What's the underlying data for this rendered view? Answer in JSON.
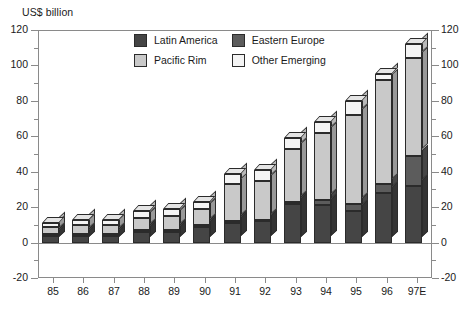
{
  "axis_title": "US$ billion",
  "legend": {
    "items": [
      {
        "label": "Latin America",
        "color": "#454545"
      },
      {
        "label": "Eastern Europe",
        "color": "#5c5c5c"
      },
      {
        "label": "Pacific Rim",
        "color": "#c9c9c9"
      },
      {
        "label": "Other Emerging",
        "color": "#f4f4f4"
      }
    ]
  },
  "chart_data": {
    "type": "bar",
    "subtype": "stacked-column-3d",
    "title": "",
    "subtitle": "",
    "xlabel": "",
    "ylabel": "US$ billion",
    "ylim": [
      -20,
      120
    ],
    "ytick_step": 20,
    "yminor_step": 10,
    "grid": false,
    "legend_position": "top-center-inside",
    "dual_axis": true,
    "categories": [
      "85",
      "86",
      "87",
      "88",
      "89",
      "90",
      "91",
      "92",
      "93",
      "94",
      "95",
      "96",
      "97E"
    ],
    "ytick_labels": [
      "-20",
      "0",
      "20",
      "40",
      "60",
      "80",
      "100",
      "120"
    ],
    "series": [
      {
        "name": "Latin America",
        "color": "#454545",
        "values": [
          4,
          4,
          4,
          6,
          6,
          9,
          11,
          12,
          22,
          21,
          18,
          28,
          32
        ]
      },
      {
        "name": "Eastern Europe",
        "color": "#5c5c5c",
        "values": [
          1,
          1,
          1,
          1,
          1,
          1,
          1,
          1,
          1,
          3,
          4,
          5,
          17
        ]
      },
      {
        "name": "Pacific Rim",
        "color": "#c9c9c9",
        "values": [
          4,
          5,
          5,
          7,
          8,
          9,
          21,
          22,
          30,
          38,
          50,
          59,
          55
        ]
      },
      {
        "name": "Other Emerging",
        "color": "#f4f4f4",
        "values": [
          2,
          3,
          3,
          4,
          4,
          4,
          6,
          6,
          6,
          6,
          8,
          3,
          8
        ]
      }
    ],
    "totals": [
      11,
      13,
      13,
      18,
      19,
      23,
      39,
      41,
      59,
      68,
      80,
      95,
      112
    ]
  }
}
